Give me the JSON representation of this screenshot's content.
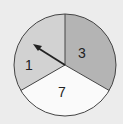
{
  "spinner": {
    "sections": [
      {
        "label": "3",
        "color": "#b4b4b4",
        "position": "right"
      },
      {
        "label": "7",
        "color": "#fafafa",
        "position": "bottom"
      },
      {
        "label": "1",
        "color": "#d2d2d2",
        "position": "left"
      }
    ],
    "arrow": {
      "points_to": "1"
    },
    "background": "#ececec",
    "outline": "#444444"
  }
}
